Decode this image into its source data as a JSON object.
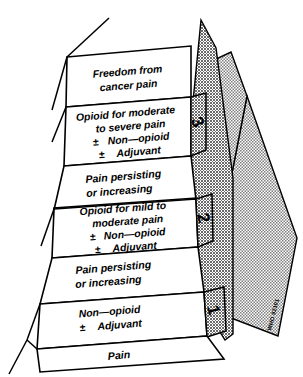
{
  "figure": {
    "goal_label": "Freedom from\ncancer pain",
    "goal_line1": "Freedom from",
    "goal_line2": "cancer pain",
    "base_label": "Pain",
    "credit": "WHO 92101",
    "colors": {
      "ink": "#000000",
      "paper": "#ffffff",
      "hatch_light": "#b9b9b9",
      "hatch_dark": "#8f8f8f"
    }
  },
  "steps": [
    {
      "number": "1",
      "lines": [
        "Non—opioid",
        "± Adjuvant"
      ],
      "line1": "Non—opioid",
      "line2_sign": "±",
      "line2_text": "Adjuvant",
      "riser_below": "Pain"
    },
    {
      "number": "2",
      "lines": [
        "Opioid for mild to",
        "moderate pain",
        "± Non—opioid",
        "± Adjuvant"
      ],
      "line1": "Opioid for mild to",
      "line2": "moderate pain",
      "line3_sign": "±",
      "line3_text": "Non—opioid",
      "line4_sign": "±",
      "line4_text": "Adjuvant",
      "riser_below_line1": "Pain persisting",
      "riser_below_line2": "or increasing"
    },
    {
      "number": "3",
      "lines": [
        "Opioid for moderate",
        "to severe pain",
        "± Non—opioid",
        "± Adjuvant"
      ],
      "line1": "Opioid for moderate",
      "line2": "to severe pain",
      "line3_sign": "±",
      "line3_text": "Non—opioid",
      "line4_sign": "±",
      "line4_text": "Adjuvant",
      "riser_below_line1": "Pain persisting",
      "riser_below_line2": "or increasing"
    }
  ],
  "risers": {
    "mid_upper_line1": "Pain persisting",
    "mid_upper_line2": "or increasing",
    "mid_lower_line1": "Pain persisting",
    "mid_lower_line2": "or increasing"
  }
}
